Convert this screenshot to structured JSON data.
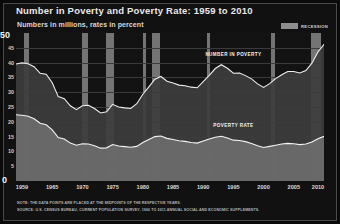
{
  "title": "Number in Poverty and Poverty Rate: 1959 to 2010",
  "subtitle": "Numbers in millions, rates in percent",
  "legend": {
    "recession_label": "RECESSION",
    "recession_color": "#8e8e8e"
  },
  "axis": {
    "y_top_label": "50",
    "y_bottom_label": "0",
    "y_ticks": [
      "45",
      "40",
      "35",
      "30",
      "25",
      "20",
      "15",
      "10",
      "5"
    ],
    "x_ticks": [
      "1959",
      "1965",
      "1970",
      "1975",
      "1980",
      "1985",
      "1990",
      "1995",
      "2000",
      "2005",
      "2010"
    ]
  },
  "series_labels": {
    "number": "NUMBER IN POVERTY",
    "rate": "POVERTY RATE"
  },
  "notes": {
    "line1": "NOTE: THE DATA POINTS ARE PLACED AT THE MIDPOINTS OF THE RESPECTIVE YEARS.",
    "line2": "SOURCE: U.S. CENSUS BUREAU, CURRENT POPULATION SURVEY, 1960 TO 2011 ANNUAL SOCIAL AND ECONOMIC SUPPLEMENTS."
  },
  "chart_data": {
    "type": "area",
    "title": "Number in Poverty and Poverty Rate: 1959 to 2010",
    "subtitle": "Numbers in millions, rates in percent",
    "xlabel": "",
    "ylabel": "",
    "ylim": [
      0,
      50
    ],
    "xlim": [
      1959,
      2010
    ],
    "grid": true,
    "legend_position": "top-right",
    "x": [
      1959,
      1960,
      1961,
      1962,
      1963,
      1964,
      1965,
      1966,
      1967,
      1968,
      1969,
      1970,
      1971,
      1972,
      1973,
      1974,
      1975,
      1976,
      1977,
      1978,
      1979,
      1980,
      1981,
      1982,
      1983,
      1984,
      1985,
      1986,
      1987,
      1988,
      1989,
      1990,
      1991,
      1992,
      1993,
      1994,
      1995,
      1996,
      1997,
      1998,
      1999,
      2000,
      2001,
      2002,
      2003,
      2004,
      2005,
      2006,
      2007,
      2008,
      2009,
      2010
    ],
    "series": [
      {
        "name": "NUMBER IN POVERTY",
        "units": "millions",
        "values": [
          39.5,
          39.9,
          39.6,
          38.6,
          36.4,
          36.1,
          33.2,
          28.5,
          27.8,
          25.4,
          24.1,
          25.4,
          25.6,
          24.5,
          23.0,
          23.4,
          25.9,
          25.0,
          24.7,
          24.5,
          26.1,
          29.3,
          31.8,
          34.4,
          35.3,
          33.7,
          33.1,
          32.4,
          32.2,
          31.7,
          31.5,
          33.6,
          35.7,
          38.0,
          39.3,
          38.1,
          36.4,
          36.5,
          35.6,
          34.5,
          32.8,
          31.6,
          32.9,
          34.6,
          35.9,
          37.0,
          37.0,
          36.5,
          37.3,
          39.8,
          43.6,
          46.2
        ]
      },
      {
        "name": "POVERTY RATE",
        "units": "percent",
        "values": [
          22.4,
          22.2,
          21.9,
          21.0,
          19.5,
          19.0,
          17.3,
          14.7,
          14.2,
          12.8,
          12.1,
          12.6,
          12.5,
          11.9,
          11.1,
          11.2,
          12.3,
          11.8,
          11.6,
          11.4,
          11.7,
          13.0,
          14.0,
          15.0,
          15.2,
          14.4,
          14.0,
          13.6,
          13.4,
          13.0,
          12.8,
          13.5,
          14.2,
          14.8,
          15.1,
          14.5,
          13.8,
          13.7,
          13.3,
          12.7,
          11.9,
          11.3,
          11.7,
          12.1,
          12.5,
          12.7,
          12.6,
          12.3,
          12.5,
          13.2,
          14.3,
          15.1
        ]
      }
    ],
    "recession_bands": [
      {
        "start": 1960.3,
        "end": 1961.2
      },
      {
        "start": 1969.9,
        "end": 1970.9
      },
      {
        "start": 1973.9,
        "end": 1975.2
      },
      {
        "start": 1980.1,
        "end": 1980.6
      },
      {
        "start": 1981.5,
        "end": 1982.9
      },
      {
        "start": 1990.6,
        "end": 1991.2
      },
      {
        "start": 2001.2,
        "end": 2001.9
      },
      {
        "start": 2007.9,
        "end": 2009.5
      }
    ],
    "annotations": [
      {
        "text": "NUMBER IN POVERTY",
        "x": 1995,
        "y": 43
      },
      {
        "text": "POVERTY RATE",
        "x": 1995,
        "y": 19
      }
    ]
  }
}
